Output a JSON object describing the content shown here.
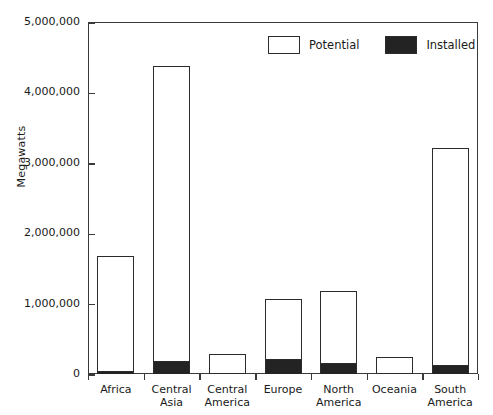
{
  "chart_data": {
    "type": "bar",
    "title": "",
    "subtitle": "",
    "xlabel": "",
    "ylabel": "Megawatts",
    "ylim": [
      0,
      5000000
    ],
    "ytick_values": [
      0,
      1000000,
      2000000,
      3000000,
      4000000,
      5000000
    ],
    "ytick_labels": [
      "0",
      "1,000,000",
      "2,000,000",
      "3,000,000",
      "4,000,000",
      "5,000,000"
    ],
    "grid": false,
    "legend_position": "top-right",
    "stacked": false,
    "overlay_note": "Installed is drawn inside the base of each Potential bar",
    "categories": [
      "Africa",
      "Central\nAsia",
      "Central\nAmerica",
      "Europe",
      "North\nAmerica",
      "Oceania",
      "South\nAmerica"
    ],
    "series": [
      {
        "name": "Potential",
        "color": "#ffffff",
        "edge_color": "#2b2b2b",
        "values": [
          1680000,
          4375000,
          285000,
          1065000,
          1180000,
          240000,
          3210000
        ]
      },
      {
        "name": "Installed",
        "color": "#232323",
        "edge_color": "#2b2b2b",
        "values": [
          40000,
          185000,
          5000,
          215000,
          160000,
          5000,
          130000
        ]
      }
    ]
  },
  "legend": {
    "items": [
      {
        "label": "Potential",
        "swatch": "potential-swatch"
      },
      {
        "label": "Installed",
        "swatch": "installed-swatch"
      }
    ]
  },
  "colors": {
    "axis": "#3a3a3a",
    "bar_edge": "#2b2b2b",
    "installed_fill": "#232323",
    "potential_fill": "#ffffff",
    "background": "#ffffff",
    "text": "#1a1a1a"
  }
}
